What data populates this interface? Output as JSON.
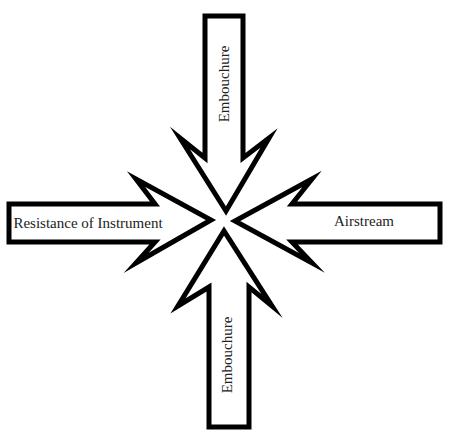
{
  "diagram": {
    "type": "converging-forces",
    "colors": {
      "background": "#ffffff",
      "stroke": "#000000",
      "text": "#222222"
    },
    "arrows": [
      {
        "id": "top",
        "label": "Embouchure",
        "direction": "down"
      },
      {
        "id": "left",
        "label": "Resistance of Instrument",
        "direction": "right"
      },
      {
        "id": "right",
        "label": "Airstream",
        "direction": "left"
      },
      {
        "id": "bottom",
        "label": "Embouchure",
        "direction": "up"
      }
    ]
  }
}
